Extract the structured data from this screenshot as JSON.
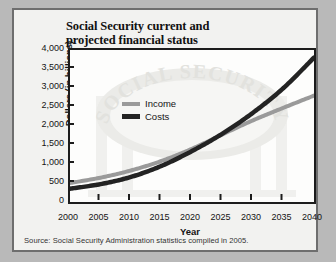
{
  "figure": {
    "title": "Social Security current and\nprojected financial status",
    "title_line1": "Social Security current and",
    "title_line2": "projected financial status",
    "source_note": "Source: Social Security Administration statistics compiled in 2005.",
    "watermark_text": "SOCIAL SECURITY",
    "colors": {
      "income": "#9a9a9a",
      "costs": "#232323",
      "page_background": "#b9b9b9",
      "card_background": "#f2f2f0",
      "plot_background": "#fdfdfc",
      "axis": "#1c1c1c",
      "card_border": "#6e6e6e"
    }
  },
  "chart_data": {
    "type": "line",
    "title": "Social Security current and projected financial status",
    "xlabel": "Year",
    "ylabel": "Dollars (in billions)",
    "xlim": [
      2000,
      2040
    ],
    "ylim": [
      0,
      4000
    ],
    "grid": false,
    "legend_position": "upper-left-inside",
    "x_tick_labels": [
      "2000",
      "2005",
      "2010",
      "2015",
      "2020",
      "2025",
      "2030",
      "2035",
      "2040"
    ],
    "y_tick_labels": [
      "0",
      "500",
      "1,000",
      "1,500",
      "2,000",
      "2,500",
      "3,000",
      "3,500",
      "4,000"
    ],
    "x_ticks": [
      2000,
      2005,
      2010,
      2015,
      2020,
      2025,
      2030,
      2035,
      2040
    ],
    "y_ticks": [
      0,
      500,
      1000,
      1500,
      2000,
      2500,
      3000,
      3500,
      4000
    ],
    "x": [
      2000,
      2005,
      2010,
      2015,
      2020,
      2025,
      2030,
      2035,
      2040
    ],
    "series": [
      {
        "name": "Income",
        "color": "#9a9a9a",
        "values": [
          500,
          640,
          830,
          1080,
          1400,
          1780,
          2150,
          2480,
          2800
        ]
      },
      {
        "name": "Costs",
        "color": "#232323",
        "values": [
          350,
          470,
          660,
          950,
          1340,
          1800,
          2350,
          3000,
          3800
        ]
      }
    ],
    "annotations": [
      "Costs curve crosses above Income curve at approximately 2027"
    ]
  }
}
